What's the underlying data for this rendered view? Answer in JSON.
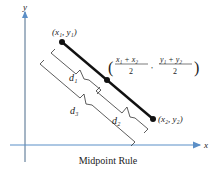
{
  "figure": {
    "caption": "Midpoint Rule",
    "axes": {
      "x_label": "x",
      "y_label": "y",
      "color": "#5b8fc7"
    },
    "points": {
      "p1": {
        "label": "(x₁, y₁)"
      },
      "p2": {
        "label": "(x₂, y₂)"
      },
      "midpoint": {
        "x_num": "x₁ + x₂",
        "x_den": "2",
        "y_num": "y₁ + y₂",
        "y_den": "2"
      }
    },
    "distances": {
      "d1": "d₁",
      "d2": "d₂",
      "d3": "d₃"
    }
  }
}
